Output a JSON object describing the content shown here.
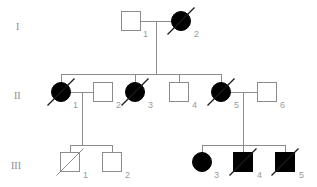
{
  "figure": {
    "kind": "pedigree-chart",
    "background_color": "#ffffff",
    "line_color": "#8c8c8c",
    "affected_color": "#000000",
    "unaffected_color": "#ffffff",
    "label_color": "#9a9a9a"
  },
  "generations": [
    {
      "label": "I",
      "x": 16,
      "y": 30
    },
    {
      "label": "II",
      "x": 14,
      "y": 99
    },
    {
      "label": "III",
      "x": 11,
      "y": 169
    }
  ],
  "individuals": [
    {
      "id": "I-1",
      "generation": "I",
      "number": "1",
      "sex": "male",
      "shape": "square",
      "affected": false,
      "deceased": false,
      "cx": 131,
      "cy": 21,
      "size": 19,
      "label_x": 143,
      "label_y": 37
    },
    {
      "id": "I-2",
      "generation": "I",
      "number": "2",
      "sex": "female",
      "shape": "circle",
      "affected": true,
      "deceased": true,
      "cx": 181,
      "cy": 21,
      "size": 19,
      "label_x": 194,
      "label_y": 37
    },
    {
      "id": "II-1",
      "generation": "II",
      "number": "1",
      "sex": "female",
      "shape": "circle",
      "affected": true,
      "deceased": true,
      "cx": 61,
      "cy": 92,
      "size": 19,
      "label_x": 73,
      "label_y": 108
    },
    {
      "id": "II-2",
      "generation": "II",
      "number": "2",
      "sex": "male",
      "shape": "square",
      "affected": false,
      "deceased": false,
      "cx": 103,
      "cy": 92,
      "size": 19,
      "label_x": 116,
      "label_y": 108
    },
    {
      "id": "II-3",
      "generation": "II",
      "number": "3",
      "sex": "female",
      "shape": "circle",
      "affected": true,
      "deceased": true,
      "cx": 135,
      "cy": 92,
      "size": 19,
      "label_x": 148,
      "label_y": 108
    },
    {
      "id": "II-4",
      "generation": "II",
      "number": "4",
      "sex": "male",
      "shape": "square",
      "affected": false,
      "deceased": false,
      "cx": 179,
      "cy": 92,
      "size": 19,
      "label_x": 192,
      "label_y": 108
    },
    {
      "id": "II-5",
      "generation": "II",
      "number": "5",
      "sex": "female",
      "shape": "circle",
      "affected": true,
      "deceased": true,
      "cx": 221,
      "cy": 92,
      "size": 19,
      "label_x": 234,
      "label_y": 108
    },
    {
      "id": "II-6",
      "generation": "II",
      "number": "6",
      "sex": "male",
      "shape": "square",
      "affected": false,
      "deceased": false,
      "cx": 267,
      "cy": 92,
      "size": 19,
      "label_x": 280,
      "label_y": 108
    },
    {
      "id": "III-1",
      "generation": "III",
      "number": "1",
      "sex": "male",
      "shape": "square",
      "affected": false,
      "deceased": true,
      "cx": 70,
      "cy": 162,
      "size": 19,
      "label_x": 83,
      "label_y": 178
    },
    {
      "id": "III-2",
      "generation": "III",
      "number": "2",
      "sex": "male",
      "shape": "square",
      "affected": false,
      "deceased": false,
      "cx": 112,
      "cy": 162,
      "size": 19,
      "label_x": 125,
      "label_y": 178
    },
    {
      "id": "III-3",
      "generation": "III",
      "number": "3",
      "sex": "female",
      "shape": "circle",
      "affected": true,
      "deceased": false,
      "cx": 202,
      "cy": 162,
      "size": 19,
      "label_x": 214,
      "label_y": 178
    },
    {
      "id": "III-4",
      "generation": "III",
      "number": "4",
      "sex": "male",
      "shape": "square",
      "affected": true,
      "deceased": true,
      "cx": 243,
      "cy": 162,
      "size": 19,
      "label_x": 257,
      "label_y": 178
    },
    {
      "id": "III-5",
      "generation": "III",
      "number": "5",
      "sex": "male",
      "shape": "square",
      "affected": true,
      "deceased": true,
      "cx": 285,
      "cy": 162,
      "size": 19,
      "label_x": 299,
      "label_y": 178
    }
  ],
  "relationships": [
    {
      "type": "mating-line",
      "partners": [
        "I-1",
        "I-2"
      ],
      "d": "M141 21 L171 21"
    },
    {
      "type": "mating-line",
      "partners": [
        "II-1",
        "II-2"
      ],
      "d": "M71 92 L93 92"
    },
    {
      "type": "mating-line",
      "partners": [
        "II-5",
        "II-6"
      ],
      "d": "M231 92 L257 92"
    },
    {
      "type": "descent-line",
      "from": "I-1xI-2",
      "d": "M156 21 L156 74"
    },
    {
      "type": "sibship-line",
      "generation": "II",
      "d": "M61 74 L221 74"
    },
    {
      "type": "sibling-drop",
      "to": "II-1",
      "d": "M61 74 L61 83"
    },
    {
      "type": "sibling-drop",
      "to": "II-3",
      "d": "M135 74 L135 83"
    },
    {
      "type": "sibling-drop",
      "to": "II-4",
      "d": "M179 74 L179 83"
    },
    {
      "type": "sibling-drop",
      "to": "II-5",
      "d": "M221 74 L221 83"
    },
    {
      "type": "descent-line",
      "from": "II-1xII-2",
      "d": "M82 92 L82 145"
    },
    {
      "type": "sibship-line",
      "generation": "III-left",
      "d": "M70 145 L112 145"
    },
    {
      "type": "sibling-drop",
      "to": "III-1",
      "d": "M70 145 L70 153"
    },
    {
      "type": "sibling-drop",
      "to": "III-2",
      "d": "M112 145 L112 153"
    },
    {
      "type": "descent-line",
      "from": "II-5xII-6",
      "d": "M243 92 L243 145"
    },
    {
      "type": "sibship-line",
      "generation": "III-right",
      "d": "M202 145 L285 145"
    },
    {
      "type": "sibling-drop",
      "to": "III-3",
      "d": "M202 145 L202 153"
    },
    {
      "type": "sibling-drop",
      "to": "III-4",
      "d": "M243 145 L243 153"
    },
    {
      "type": "sibling-drop",
      "to": "III-5",
      "d": "M285 145 L285 153"
    }
  ]
}
